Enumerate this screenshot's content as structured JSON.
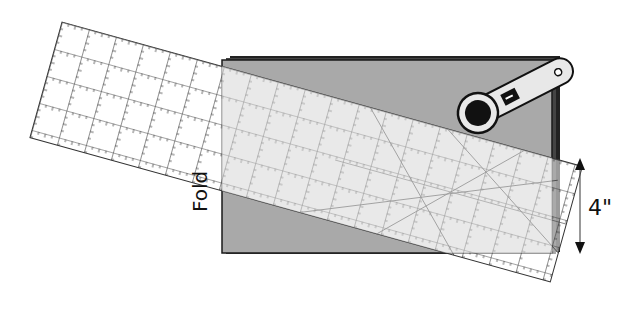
{
  "diagram": {
    "labels": {
      "fold": "Fold",
      "measurement": "4\""
    },
    "colors": {
      "fabric": "#a9a9a9",
      "fabric_edge": "#1a1a1a",
      "ruler_fill": "#ffffff",
      "ruler_overlap": "#d4d4d4",
      "grid_line": "#333333",
      "cutter_body": "#e8e8e8",
      "cutter_blade": "#111111"
    },
    "elements": [
      {
        "id": "fabric",
        "type": "folded fabric stack"
      },
      {
        "id": "ruler",
        "type": "quilting ruler with grid and diagonal lines"
      },
      {
        "id": "rotary-cutter",
        "type": "rotary cutter"
      },
      {
        "id": "dimension-arrow",
        "type": "double-headed arrow"
      }
    ]
  }
}
